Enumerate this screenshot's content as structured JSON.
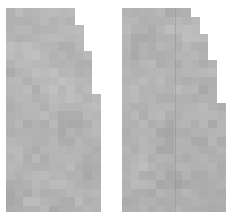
{
  "canvas": {
    "width": 238,
    "height": 224,
    "background": "#ffffff"
  },
  "render": {
    "block_size": 8.6,
    "edge_style": "stepped",
    "texture": "mottled-gray",
    "gray_min": "#9a9a9a",
    "gray_max": "#c8c8c8",
    "gray_base": "#b2b2b2"
  },
  "panels": [
    {
      "id": "left-panel",
      "name": "quarter-ellipse-left",
      "x": 6,
      "y": 8,
      "width": 98,
      "height": 204,
      "flat_edge": "left",
      "baseline_edge": "bottom",
      "curve": "convex-top-right",
      "apex_width": 52,
      "seed": 1471,
      "gray_mean": 178,
      "gray_spread": 21,
      "seam": null
    },
    {
      "id": "right-panel",
      "name": "quarter-ellipse-right",
      "x": 122,
      "y": 8,
      "width": 106,
      "height": 204,
      "flat_edge": "left",
      "baseline_edge": "bottom",
      "curve": "convex-top-right",
      "apex_width": 56,
      "seed": 8803,
      "gray_mean": 176,
      "gray_spread": 22,
      "seam": {
        "name": "vertical-seam-line",
        "offset_x": 53,
        "color": "#8e8e8e",
        "opacity": 0.45
      }
    }
  ]
}
